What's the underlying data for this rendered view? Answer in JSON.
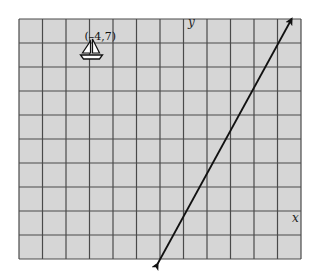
{
  "figure": {
    "grid": {
      "columns": 12,
      "rows": 10,
      "x_min": -7,
      "x_max": 5,
      "y_min": -2,
      "y_max": 8,
      "background_color": "#d6d6d6",
      "line_color": "#4a4a4a"
    },
    "axes": {
      "x_label": "x",
      "y_label": "y"
    },
    "point": {
      "label": "(–4,7)",
      "x": -4,
      "y": 7,
      "icon": "sailboat-icon"
    },
    "line": {
      "description": "straight line with arrows at both ends",
      "start": {
        "x": -1.1,
        "y": -2.2
      },
      "end": {
        "x": 4.6,
        "y": 8.0
      },
      "color": "#111111"
    }
  }
}
